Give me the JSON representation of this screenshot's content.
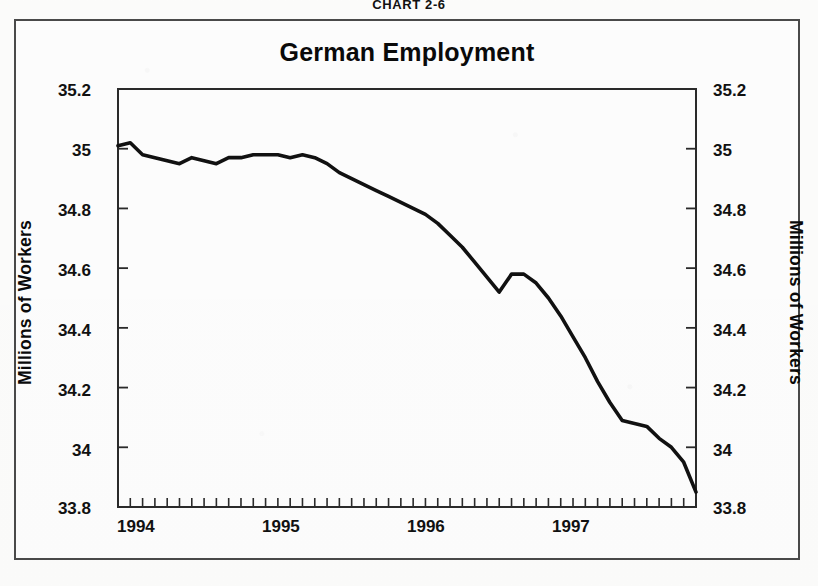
{
  "caption": {
    "prefix": "C",
    "text": "HART",
    "number": "2-6",
    "full": "CHART 2-6"
  },
  "chart": {
    "title": "German Employment",
    "ylabel_left": "Millions of Workers",
    "ylabel_right": "Millions of Workers",
    "y_ticks": [
      "33.8",
      "34",
      "34.2",
      "34.4",
      "34.6",
      "34.8",
      "35",
      "35.2"
    ],
    "x_ticks": [
      "1994",
      "1995",
      "1996",
      "1997"
    ],
    "line_color": "#111111",
    "frame_color": "#2a2a2a",
    "background": "#fefefe"
  },
  "chart_data": {
    "type": "line",
    "title": "German Employment",
    "xlabel": "",
    "ylabel": "Millions of Workers",
    "ylim": [
      33.8,
      35.2
    ],
    "xlim": [
      "1994-01",
      "1997-12"
    ],
    "yticks": [
      33.8,
      34.0,
      34.2,
      34.4,
      34.6,
      34.8,
      35.0,
      35.2
    ],
    "ytick_labels": [
      "33.8",
      "34",
      "34.2",
      "34.4",
      "34.6",
      "34.8",
      "35",
      "35.2"
    ],
    "xticks": [
      "1994",
      "1995",
      "1996",
      "1997"
    ],
    "x_minor_ticks": "monthly",
    "grid": false,
    "legend": false,
    "dual_axis": true,
    "right_axis_label": "Millions of Workers",
    "series": [
      {
        "name": "German Employment",
        "units": "millions of workers",
        "x": [
          "1994-01",
          "1994-02",
          "1994-03",
          "1994-04",
          "1994-05",
          "1994-06",
          "1994-07",
          "1994-08",
          "1994-09",
          "1994-10",
          "1994-11",
          "1994-12",
          "1995-01",
          "1995-02",
          "1995-03",
          "1995-04",
          "1995-05",
          "1995-06",
          "1995-07",
          "1995-08",
          "1995-09",
          "1995-10",
          "1995-11",
          "1995-12",
          "1996-01",
          "1996-02",
          "1996-03",
          "1996-04",
          "1996-05",
          "1996-06",
          "1996-07",
          "1996-08",
          "1996-09",
          "1996-10",
          "1996-11",
          "1996-12",
          "1997-01",
          "1997-02",
          "1997-03",
          "1997-04",
          "1997-05",
          "1997-06",
          "1997-07",
          "1997-08",
          "1997-09",
          "1997-10",
          "1997-11",
          "1997-12"
        ],
        "values": [
          35.01,
          35.02,
          34.98,
          34.97,
          34.96,
          34.95,
          34.97,
          34.96,
          34.95,
          34.97,
          34.97,
          34.98,
          34.98,
          34.98,
          34.97,
          34.98,
          34.97,
          34.95,
          34.92,
          34.9,
          34.88,
          34.86,
          34.84,
          34.82,
          34.8,
          34.78,
          34.75,
          34.71,
          34.67,
          34.62,
          34.57,
          34.52,
          34.58,
          34.58,
          34.55,
          34.5,
          34.44,
          34.37,
          34.3,
          34.22,
          34.15,
          34.09,
          34.08,
          34.07,
          34.03,
          34.0,
          33.95,
          33.85
        ]
      }
    ]
  }
}
